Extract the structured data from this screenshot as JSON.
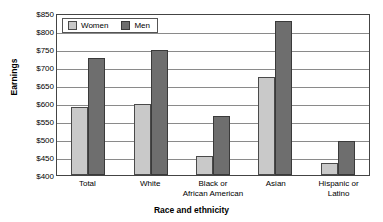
{
  "chart_data": {
    "type": "bar",
    "title": "",
    "xlabel": "Race and ethnicity",
    "ylabel": "Earnings",
    "ylim": [
      400,
      850
    ],
    "ytick_step": 50,
    "yticks": [
      "$850",
      "$800",
      "$750",
      "$700",
      "$650",
      "$600",
      "$550",
      "$500",
      "$450",
      "$400"
    ],
    "ytick_values": [
      850,
      800,
      750,
      700,
      650,
      600,
      550,
      500,
      450,
      400
    ],
    "grid": true,
    "legend_position": "top-left",
    "categories": [
      "Total",
      "White",
      "Black or African American",
      "Asian",
      "Hispanic or Latino"
    ],
    "category_lines": [
      [
        "Total"
      ],
      [
        "White"
      ],
      [
        "Black or",
        "African American"
      ],
      [
        "Asian"
      ],
      [
        "Hispanic or",
        "Latino"
      ]
    ],
    "series": [
      {
        "name": "Women",
        "color": "#c9c9c9",
        "values": [
          588,
          598,
          454,
          671,
          434
        ]
      },
      {
        "name": "Men",
        "color": "#6e6e6e",
        "values": [
          725,
          748,
          564,
          828,
          495
        ]
      }
    ]
  },
  "legend": {
    "items": [
      {
        "label": "Women",
        "swatch": "women-swatch"
      },
      {
        "label": "Men",
        "swatch": "men-swatch"
      }
    ]
  }
}
